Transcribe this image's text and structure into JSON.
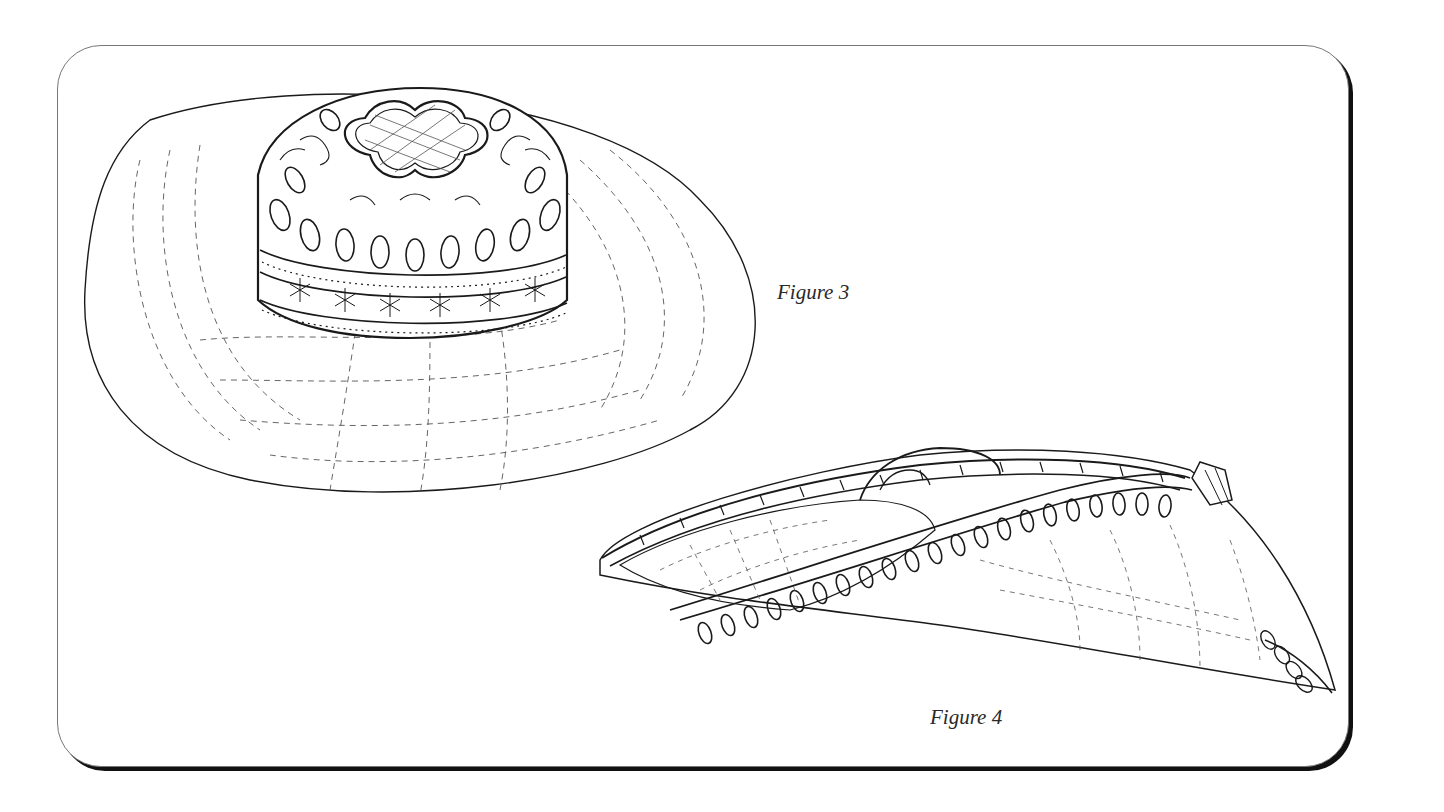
{
  "plate": {
    "border_color": "#777777",
    "shadow_color": "#111111",
    "background": "#ffffff"
  },
  "figures": [
    {
      "id": "figure-3",
      "caption": "Figure 3",
      "subject": "hat-wide-brim-top-view",
      "description": "Wide woven brim hat with lace-patterned crown, quatrefoil top panel, paisley motifs and dotted band"
    },
    {
      "id": "figure-4",
      "caption": "Figure 4",
      "subject": "hat-side-profile",
      "description": "Side profile of hat brim with scalloped lace edging and looped trim"
    }
  ],
  "colors": {
    "ink": "#1a1a1a",
    "hatch": "#555555"
  }
}
